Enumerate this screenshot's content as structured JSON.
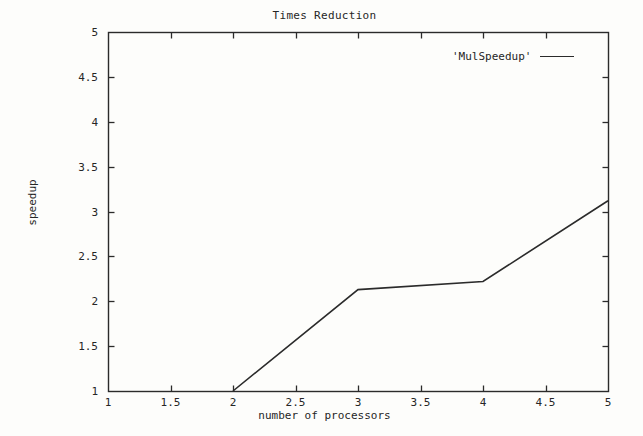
{
  "chart_data": {
    "type": "line",
    "title": "Times Reduction",
    "xlabel": "number of processors",
    "ylabel": "speedup",
    "xlim": [
      1,
      5
    ],
    "ylim": [
      1,
      5
    ],
    "grid": false,
    "legend_position": "top-right",
    "xticks": [
      "1",
      "1.5",
      "2",
      "2.5",
      "3",
      "3.5",
      "4",
      "4.5",
      "5"
    ],
    "xtick_values": [
      1,
      1.5,
      2,
      2.5,
      3,
      3.5,
      4,
      4.5,
      5
    ],
    "yticks": [
      "1",
      "1.5",
      "2",
      "2.5",
      "3",
      "3.5",
      "4",
      "4.5",
      "5"
    ],
    "ytick_values": [
      1,
      1.5,
      2,
      2.5,
      3,
      3.5,
      4,
      4.5,
      5
    ],
    "series": [
      {
        "name": "'MulSpeedup'",
        "color": "#2b2b2b",
        "x": [
          2,
          3,
          4,
          5
        ],
        "y": [
          1.0,
          2.13,
          2.22,
          3.12
        ]
      }
    ]
  },
  "legend": {
    "entries": [
      {
        "label": "'MulSpeedup'",
        "swatch": "line-swatch"
      }
    ]
  },
  "plot_box": {
    "left": 108,
    "right": 608,
    "top": 32,
    "bottom": 391
  }
}
